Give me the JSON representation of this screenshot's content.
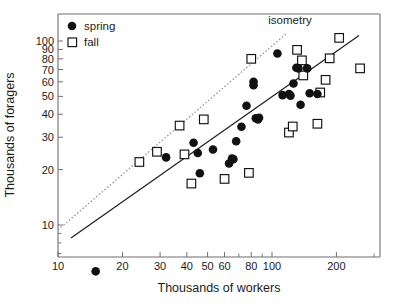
{
  "chart_data": {
    "type": "scatter",
    "title": "",
    "xlabel": "Thousands of workers",
    "ylabel": "Thousands of foragers",
    "xscale": "log",
    "yscale": "log",
    "xlim": [
      10,
      280
    ],
    "ylim": [
      5,
      130
    ],
    "grid": false,
    "legend_position": "top-left",
    "xticks": [
      10,
      20,
      30,
      40,
      50,
      60,
      80,
      100,
      200
    ],
    "xticklabels": [
      "10",
      "20",
      "30",
      "40",
      "50",
      "60",
      "80",
      "100",
      "200"
    ],
    "yticks": [
      10,
      20,
      30,
      40,
      50,
      60,
      70,
      80,
      90,
      100
    ],
    "yticklabels": [
      "10",
      "20",
      "30",
      "40",
      "50",
      "60",
      "70",
      "80",
      "90",
      "100"
    ],
    "annotations": [
      {
        "text": "isometry",
        "x": 140,
        "y": 125
      }
    ],
    "series": [
      {
        "name": "spring",
        "marker": "filled-circle",
        "color": "#111111",
        "points": [
          [
            15,
            5.6
          ],
          [
            32,
            23.3
          ],
          [
            43,
            28.0
          ],
          [
            45,
            24.6
          ],
          [
            46,
            19.1
          ],
          [
            53,
            25.7
          ],
          [
            63,
            21.6
          ],
          [
            65,
            23.0
          ],
          [
            66,
            22.8
          ],
          [
            68,
            28.5
          ],
          [
            72,
            34.2
          ],
          [
            76,
            44.5
          ],
          [
            82,
            60.0
          ],
          [
            82,
            57.5
          ],
          [
            84,
            38.0
          ],
          [
            86,
            37.5
          ],
          [
            87,
            38.3
          ],
          [
            106,
            85.5
          ],
          [
            112,
            50.8
          ],
          [
            120,
            51.5
          ],
          [
            122,
            50.5
          ],
          [
            126,
            58.8
          ],
          [
            130,
            71.5
          ],
          [
            133,
            71.0
          ],
          [
            136,
            45.0
          ],
          [
            146,
            71.0
          ],
          [
            150,
            52.0
          ],
          [
            163,
            51.5
          ]
        ]
      },
      {
        "name": "fall",
        "marker": "open-square",
        "color": "#ffffff",
        "edgecolor": "#111111",
        "points": [
          [
            24,
            22.0
          ],
          [
            29,
            25.0
          ],
          [
            37,
            34.7
          ],
          [
            39,
            24.2
          ],
          [
            42,
            16.8
          ],
          [
            48,
            37.5
          ],
          [
            60,
            17.8
          ],
          [
            78,
            19.2
          ],
          [
            80,
            80.0
          ],
          [
            120,
            31.8
          ],
          [
            125,
            34.3
          ],
          [
            131,
            89.5
          ],
          [
            138,
            78.5
          ],
          [
            140,
            65.0
          ],
          [
            163,
            35.5
          ],
          [
            168,
            52.5
          ],
          [
            178,
            61.5
          ],
          [
            186,
            80.5
          ],
          [
            206,
            104.0
          ],
          [
            258,
            71.0
          ]
        ]
      }
    ],
    "lines": [
      {
        "name": "isometry",
        "style": "dotted",
        "color": "#8d8d8d",
        "x": [
          10,
          117
        ],
        "y": [
          9.4,
          110
        ]
      },
      {
        "name": "regression-fit",
        "style": "solid",
        "color": "#111111",
        "x": [
          11.5,
          255
        ],
        "y": [
          8.5,
          107
        ]
      }
    ]
  },
  "legend": {
    "items": [
      {
        "label": "spring",
        "marker": "filled-circle"
      },
      {
        "label": "fall",
        "marker": "open-square"
      }
    ]
  },
  "axes": {
    "x_label": "Thousands of workers",
    "y_label": "Thousands of foragers"
  }
}
